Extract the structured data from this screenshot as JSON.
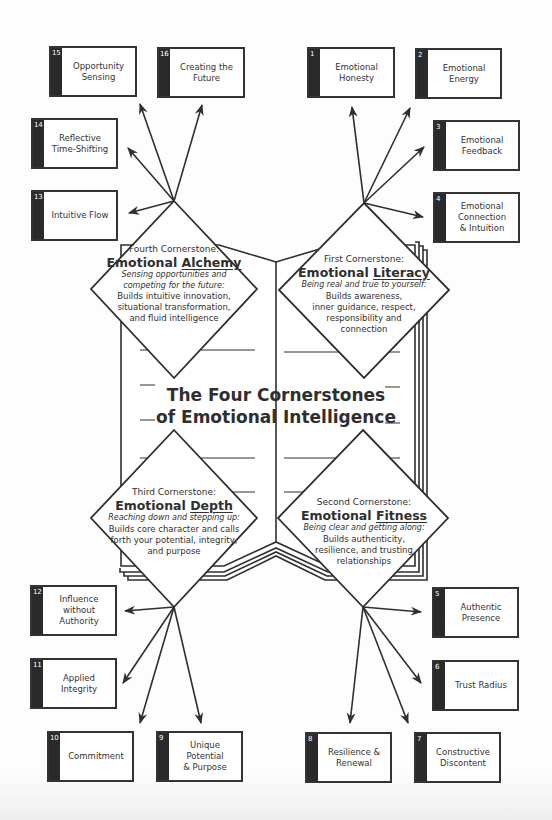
{
  "main_title": {
    "line1": "The Four Cornerstones",
    "line2": "of Emotional Intelligence"
  },
  "cornerstones": [
    {
      "position": "top-right",
      "label": "First Cornerstone:",
      "title_prefix": "Emotional",
      "title_keyword": "Literacy",
      "tagline": "Being real and true to yourself:",
      "body": "Builds awareness,\ninner guidance, respect,\nresponsibility and\nconnection"
    },
    {
      "position": "bottom-right",
      "label": "Second Cornerstone:",
      "title_prefix": "Emotional",
      "title_keyword": "Fitness",
      "tagline": "Being clear and getting along:",
      "body": "Builds authenticity,\nresilience, and trusting\nrelationships"
    },
    {
      "position": "bottom-left",
      "label": "Third Cornerstone:",
      "title_prefix": "Emotional",
      "title_keyword": "Depth",
      "tagline": "Reaching down and stepping up:",
      "body": "Builds core character and calls\nforth your potential, integrity,\nand purpose"
    },
    {
      "position": "top-left",
      "label": "Fourth Cornerstone:",
      "title_prefix": "Emotional",
      "title_keyword": "Alchemy",
      "tagline": "Sensing opportunities and\ncompeting for the future:",
      "body": "Builds intuitive innovation,\nsituational transformation,\nand fluid intelligence"
    }
  ],
  "boxes": [
    {
      "num": "1",
      "label": "Emotional\nHonesty"
    },
    {
      "num": "2",
      "label": "Emotional\nEnergy"
    },
    {
      "num": "3",
      "label": "Emotional\nFeedback"
    },
    {
      "num": "4",
      "label": "Emotional\nConnection\n& Intuition"
    },
    {
      "num": "5",
      "label": "Authentic\nPresence"
    },
    {
      "num": "6",
      "label": "Trust Radius"
    },
    {
      "num": "7",
      "label": "Constructive\nDiscontent"
    },
    {
      "num": "8",
      "label": "Resilience &\nRenewal"
    },
    {
      "num": "9",
      "label": "Unique Potential\n& Purpose"
    },
    {
      "num": "10",
      "label": "Commitment"
    },
    {
      "num": "11",
      "label": "Applied Integrity"
    },
    {
      "num": "12",
      "label": "Influence\nwithout\nAuthority"
    },
    {
      "num": "13",
      "label": "Intuitive Flow"
    },
    {
      "num": "14",
      "label": "Reflective\nTime-Shifting"
    },
    {
      "num": "15",
      "label": "Opportunity\nSensing"
    },
    {
      "num": "16",
      "label": "Creating the\nFuture"
    }
  ],
  "colors": {
    "line": "#2f2f2f",
    "strip": "#2a2a2a",
    "background": "#fdfdfd"
  }
}
